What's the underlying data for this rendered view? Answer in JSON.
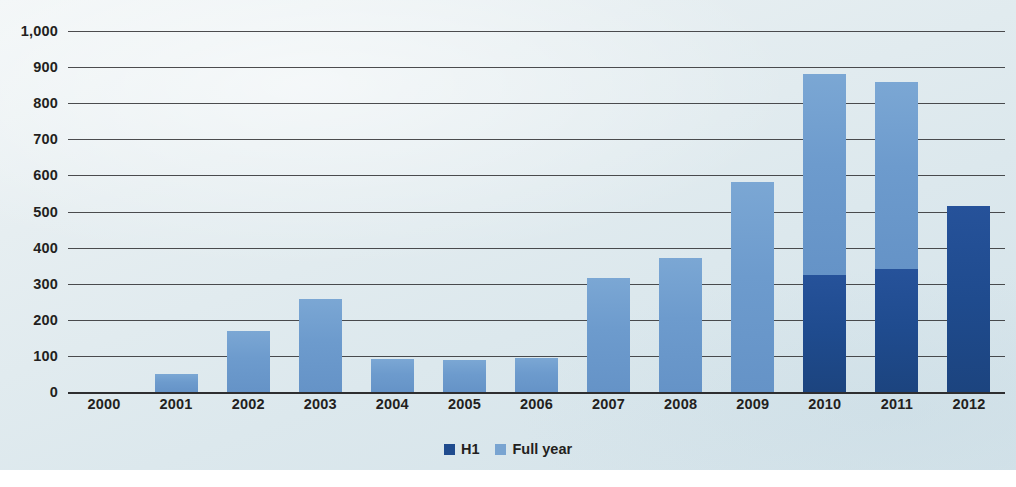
{
  "chart_data": {
    "type": "bar",
    "title": "",
    "subtitle": "",
    "xlabel": "",
    "ylabel": "",
    "stacked": true,
    "grid": true,
    "legend_position": "bottom-center",
    "ylim": [
      0,
      1000
    ],
    "ytick_step": 100,
    "ytick_labels": [
      "1,000",
      "900",
      "800",
      "700",
      "600",
      "500",
      "400",
      "300",
      "200",
      "100",
      "0"
    ],
    "ytick_values": [
      1000,
      900,
      800,
      700,
      600,
      500,
      400,
      300,
      200,
      100,
      0
    ],
    "categories": [
      "2000",
      "2001",
      "2002",
      "2003",
      "2004",
      "2005",
      "2006",
      "2007",
      "2008",
      "2009",
      "2010",
      "2011",
      "2012"
    ],
    "series": [
      {
        "name": "H1",
        "color": "#1f4b8e",
        "values": [
          0,
          0,
          0,
          0,
          0,
          0,
          0,
          0,
          0,
          0,
          325,
          340,
          515
        ]
      },
      {
        "name": "Full year",
        "color": "#79a4d1",
        "values": [
          0,
          50,
          170,
          258,
          92,
          90,
          95,
          315,
          370,
          582,
          880,
          860,
          0
        ]
      }
    ],
    "legend": [
      {
        "label": "H1",
        "color": "#1f4b8e",
        "swatch": "legend-swatch-h1"
      },
      {
        "label": "Full year",
        "color": "#79a4d1",
        "swatch": "legend-swatch-full-year"
      }
    ]
  },
  "colors": {
    "h1": "#1f4b8e",
    "full_year": "#79a4d1",
    "gridline": "#2e2e30",
    "text": "#231f20",
    "panel_background": "#e2ecf0"
  }
}
